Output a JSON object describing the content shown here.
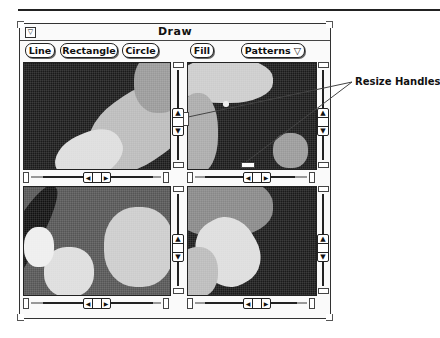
{
  "window": {
    "title": "Draw",
    "menu_button_glyph": "▽"
  },
  "toolbar": {
    "buttons": [
      {
        "label": "Line"
      },
      {
        "label": "Rectangle"
      },
      {
        "label": "Circle"
      },
      {
        "label": "Fill"
      },
      {
        "label": "Patterns ▽"
      }
    ]
  },
  "panes": [
    {
      "position": "top-left",
      "content": "astronaut image (arm, dark space background)"
    },
    {
      "position": "top-right",
      "content": "astronaut image (helmet visor)"
    },
    {
      "position": "bottom-left",
      "content": "astronaut image (torso, equipment)"
    },
    {
      "position": "bottom-right",
      "content": "astronaut image (glove, dark background)"
    }
  ],
  "scrollbar": {
    "up_glyph": "▲",
    "down_glyph": "▼",
    "left_glyph": "◀",
    "right_glyph": "▶"
  },
  "annotation": {
    "label": "Resize Handles"
  },
  "colors": {
    "frame": "#333333",
    "background": "#ffffff",
    "image_dark": "#1a1a1a"
  }
}
